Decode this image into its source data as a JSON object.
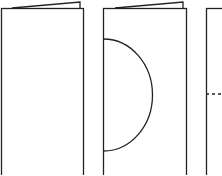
{
  "diagram": {
    "stroke_color": "#222222",
    "background": "#ffffff",
    "panels": [
      {
        "id": "step-1",
        "shape": "folded-card"
      },
      {
        "id": "step-2",
        "shape": "folded-card-with-semicircle"
      },
      {
        "id": "step-3",
        "shape": "folded-card-with-dashed-line"
      }
    ]
  }
}
